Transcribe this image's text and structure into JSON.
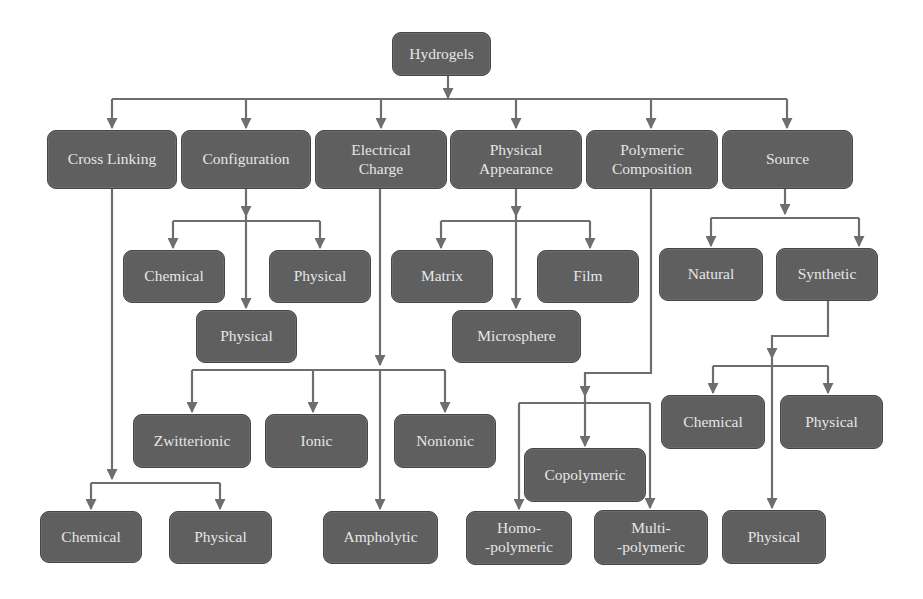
{
  "diagram": {
    "title": "Hydrogels",
    "colors": {
      "node_fill": "#5f5f5f",
      "node_border": "#454545",
      "node_text": "#e6e6e6",
      "connector": "#6e6e6e",
      "background": "#ffffff"
    },
    "nodes": [
      {
        "id": "hydrogels",
        "label": "Hydrogels",
        "x": 392,
        "y": 32,
        "w": 99,
        "h": 44
      },
      {
        "id": "cross-linking",
        "label": "Cross Linking",
        "x": 47,
        "y": 130,
        "w": 130,
        "h": 59
      },
      {
        "id": "configuration",
        "label": "Configuration",
        "x": 181,
        "y": 130,
        "w": 130,
        "h": 59
      },
      {
        "id": "electrical-charge",
        "label": "Electrical\nCharge",
        "x": 315,
        "y": 130,
        "w": 132,
        "h": 59
      },
      {
        "id": "physical-appearance",
        "label": "Physical\nAppearance",
        "x": 450,
        "y": 130,
        "w": 132,
        "h": 59
      },
      {
        "id": "polymeric-composition",
        "label": "Polymeric\nComposition",
        "x": 586,
        "y": 130,
        "w": 132,
        "h": 59
      },
      {
        "id": "source",
        "label": "Source",
        "x": 722,
        "y": 130,
        "w": 131,
        "h": 59
      },
      {
        "id": "configuration-chemical",
        "label": "Chemical",
        "x": 123,
        "y": 250,
        "w": 102,
        "h": 53
      },
      {
        "id": "configuration-physical-right",
        "label": "Physical",
        "x": 269,
        "y": 250,
        "w": 102,
        "h": 53
      },
      {
        "id": "configuration-physical-center",
        "label": "Physical",
        "x": 196,
        "y": 310,
        "w": 101,
        "h": 53
      },
      {
        "id": "appearance-matrix",
        "label": "Matrix",
        "x": 391,
        "y": 250,
        "w": 102,
        "h": 53
      },
      {
        "id": "appearance-film",
        "label": "Film",
        "x": 537,
        "y": 250,
        "w": 102,
        "h": 53
      },
      {
        "id": "appearance-microsphere",
        "label": "Microsphere",
        "x": 452,
        "y": 310,
        "w": 129,
        "h": 53
      },
      {
        "id": "source-natural",
        "label": "Natural",
        "x": 659,
        "y": 248,
        "w": 104,
        "h": 53
      },
      {
        "id": "source-synthetic",
        "label": "Synthetic",
        "x": 776,
        "y": 248,
        "w": 102,
        "h": 53
      },
      {
        "id": "charge-zwitterionic",
        "label": "Zwitterionic",
        "x": 133,
        "y": 414,
        "w": 118,
        "h": 54
      },
      {
        "id": "charge-ionic",
        "label": "Ionic",
        "x": 265,
        "y": 414,
        "w": 103,
        "h": 54
      },
      {
        "id": "charge-nonionic",
        "label": "Nonionic",
        "x": 394,
        "y": 414,
        "w": 102,
        "h": 54
      },
      {
        "id": "synthetic-chemical",
        "label": "Chemical",
        "x": 661,
        "y": 395,
        "w": 104,
        "h": 54
      },
      {
        "id": "synthetic-physical-right",
        "label": "Physical",
        "x": 780,
        "y": 395,
        "w": 103,
        "h": 54
      },
      {
        "id": "composition-copolymeric",
        "label": "Copolymeric",
        "x": 524,
        "y": 448,
        "w": 122,
        "h": 54
      },
      {
        "id": "crosslinking-chemical",
        "label": "Chemical",
        "x": 40,
        "y": 511,
        "w": 102,
        "h": 52
      },
      {
        "id": "crosslinking-physical",
        "label": "Physical",
        "x": 169,
        "y": 511,
        "w": 103,
        "h": 53
      },
      {
        "id": "charge-ampholytic",
        "label": "Ampholytic",
        "x": 323,
        "y": 511,
        "w": 115,
        "h": 53
      },
      {
        "id": "composition-homopolymeric",
        "label": "Homo-\n-polymeric",
        "x": 466,
        "y": 511,
        "w": 106,
        "h": 54
      },
      {
        "id": "composition-multipolymeric",
        "label": "Multi-\n-polymeric",
        "x": 594,
        "y": 510,
        "w": 114,
        "h": 55
      },
      {
        "id": "synthetic-physical-bottom",
        "label": "Physical",
        "x": 722,
        "y": 510,
        "w": 104,
        "h": 54
      }
    ],
    "edges": [
      {
        "from": "hydrogels",
        "to": "cross-linking"
      },
      {
        "from": "hydrogels",
        "to": "configuration"
      },
      {
        "from": "hydrogels",
        "to": "electrical-charge"
      },
      {
        "from": "hydrogels",
        "to": "physical-appearance"
      },
      {
        "from": "hydrogels",
        "to": "polymeric-composition"
      },
      {
        "from": "hydrogels",
        "to": "source"
      },
      {
        "from": "configuration",
        "to": "configuration-chemical"
      },
      {
        "from": "configuration",
        "to": "configuration-physical-center"
      },
      {
        "from": "configuration",
        "to": "configuration-physical-right"
      },
      {
        "from": "physical-appearance",
        "to": "appearance-matrix"
      },
      {
        "from": "physical-appearance",
        "to": "appearance-microsphere"
      },
      {
        "from": "physical-appearance",
        "to": "appearance-film"
      },
      {
        "from": "source",
        "to": "source-natural"
      },
      {
        "from": "source",
        "to": "source-synthetic"
      },
      {
        "from": "electrical-charge",
        "to": "charge-zwitterionic"
      },
      {
        "from": "electrical-charge",
        "to": "charge-ionic"
      },
      {
        "from": "electrical-charge",
        "to": "charge-nonionic"
      },
      {
        "from": "electrical-charge",
        "to": "charge-ampholytic"
      },
      {
        "from": "source-synthetic",
        "to": "synthetic-chemical"
      },
      {
        "from": "source-synthetic",
        "to": "synthetic-physical-right"
      },
      {
        "from": "source-synthetic",
        "to": "synthetic-physical-bottom"
      },
      {
        "from": "polymeric-composition",
        "to": "composition-homopolymeric"
      },
      {
        "from": "polymeric-composition",
        "to": "composition-copolymeric"
      },
      {
        "from": "polymeric-composition",
        "to": "composition-multipolymeric"
      },
      {
        "from": "cross-linking",
        "to": "crosslinking-chemical"
      },
      {
        "from": "cross-linking",
        "to": "crosslinking-physical"
      }
    ]
  }
}
